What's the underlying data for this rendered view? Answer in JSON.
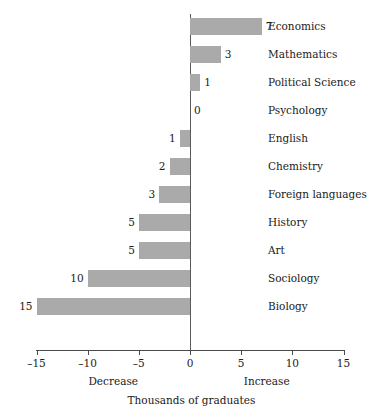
{
  "chart_data": {
    "type": "bar",
    "orientation": "horizontal",
    "title": "",
    "xlabel": "Thousands of graduates",
    "ylabel": "",
    "xlim": [
      -15,
      15
    ],
    "xticks": [
      -15,
      -10,
      -5,
      0,
      5,
      10,
      15
    ],
    "xtick_labels": [
      "–15",
      "–10",
      "–5",
      "0",
      "5",
      "10",
      "15"
    ],
    "grid": false,
    "legend": null,
    "bar_color": "#aaaaaa",
    "axis_color": "#4a4a4a",
    "text_color": "#1a1a1a",
    "categories": [
      "Economics",
      "Mathematics",
      "Political Science",
      "Psychology",
      "English",
      "Chemistry",
      "Foreign languages",
      "History",
      "Art",
      "Sociology",
      "Biology"
    ],
    "values": [
      7,
      3,
      1,
      0,
      -1,
      -2,
      -3,
      -5,
      -5,
      -10,
      -15
    ],
    "data_labels": [
      "7",
      "3",
      "1",
      "0",
      "1",
      "2",
      "3",
      "5",
      "5",
      "10",
      "15"
    ],
    "annotations": {
      "left_direction": "Decrease",
      "right_direction": "Increase",
      "left_direction_x": -7.5,
      "right_direction_x": 7.5
    }
  }
}
